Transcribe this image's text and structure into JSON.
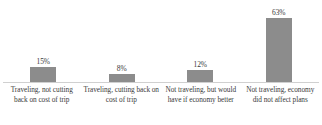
{
  "chart_data": {
    "type": "bar",
    "title": "",
    "subtitle": "",
    "xlabel": "",
    "ylabel": "",
    "categories": [
      "Traveling, not cutting back on cost of trip",
      "Traveling, cutting back on cost of trip",
      "Not traveling, but would have if economy better",
      "Not traveling, economy did not affect plans"
    ],
    "values": [
      15,
      8,
      12,
      63
    ],
    "value_labels": [
      "15%",
      "8%",
      "12%",
      "63%"
    ],
    "ylim": [
      0,
      63
    ],
    "grid": false,
    "legend": false,
    "legend_position": "none",
    "orientation": "vertical",
    "bar_color": "#8c8c8c",
    "axis_color": "#d0d0d0",
    "text_color": "#3a3a3a",
    "background": "#ffffff"
  },
  "bars": [
    {
      "label": "Traveling, not cutting back on cost of trip",
      "value_label": "15%",
      "value": 15
    },
    {
      "label": "Traveling, cutting back on cost of trip",
      "value_label": "8%",
      "value": 8
    },
    {
      "label": "Not traveling, but would have if economy better",
      "value_label": "12%",
      "value": 12
    },
    {
      "label": "Not traveling, economy did not affect plans",
      "value_label": "63%",
      "value": 63
    }
  ]
}
